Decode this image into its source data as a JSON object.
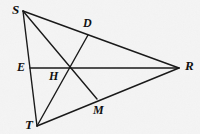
{
  "figure": {
    "background_color": "#f4f4f4",
    "line_color": "#1a1a1a",
    "label_color": "#111111",
    "width": 200,
    "height": 134,
    "points": [
      {
        "id": "S",
        "label": "S",
        "x": 23,
        "y": 11,
        "label_x": 12,
        "label_y": 14,
        "kind": "vertex"
      },
      {
        "id": "T",
        "label": "T",
        "x": 37,
        "y": 126,
        "label_x": 25,
        "label_y": 129,
        "kind": "vertex"
      },
      {
        "id": "R",
        "label": "R",
        "x": 179,
        "y": 68,
        "label_x": 185,
        "label_y": 70,
        "kind": "vertex"
      },
      {
        "id": "D",
        "label": "D",
        "x": 88,
        "y": 35,
        "label_x": 83,
        "label_y": 27,
        "kind": "foot"
      },
      {
        "id": "E",
        "label": "E",
        "x": 30,
        "y": 68,
        "label_x": 17,
        "label_y": 71,
        "kind": "foot"
      },
      {
        "id": "M",
        "label": "M",
        "x": 97,
        "y": 99,
        "label_x": 93,
        "label_y": 114,
        "kind": "foot"
      },
      {
        "id": "H",
        "label": "H",
        "x": 69,
        "y": 68,
        "label_x": 49,
        "label_y": 80,
        "kind": "intersection"
      }
    ],
    "segments": [
      {
        "id": "SR",
        "from": "S",
        "to": "R",
        "name": "side-sr"
      },
      {
        "id": "ST",
        "from": "S",
        "to": "T",
        "name": "side-st"
      },
      {
        "id": "TR",
        "from": "T",
        "to": "R",
        "name": "side-tr"
      },
      {
        "id": "SM",
        "from": "S",
        "to": "M",
        "name": "cevian-s-to-m"
      },
      {
        "id": "TD",
        "from": "T",
        "to": "D",
        "name": "cevian-t-to-d"
      },
      {
        "id": "ER",
        "from": "E",
        "to": "R",
        "name": "cevian-e-to-r"
      }
    ]
  }
}
